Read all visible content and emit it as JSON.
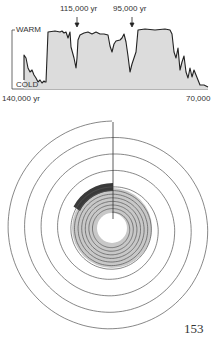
{
  "chart_data": {
    "type": "area",
    "title": "",
    "xlabel": "",
    "ylabel": "",
    "y_labels": {
      "top": "WARM",
      "bottom": "COLD"
    },
    "x_axis": {
      "start_label": "140,000 yr",
      "end_label": "70,000",
      "range": [
        140000,
        70000
      ],
      "ticks": 7
    },
    "annotations": [
      {
        "label": "115,000 yr",
        "x": 115000,
        "marker": "arrow-down"
      },
      {
        "label": "95,000 yr",
        "x": 95000,
        "marker": "arrow-down"
      }
    ],
    "series": [
      {
        "name": "climate temperature proxy",
        "x": [
          128600,
          128400,
          128200,
          128000,
          127600,
          127300,
          127000,
          126500,
          126100,
          125700,
          125300,
          125000,
          124800,
          124400,
          123000,
          122000,
          120800,
          120500,
          120000,
          119700,
          119100,
          118800,
          118300,
          118100,
          117500,
          116800,
          116000,
          115200,
          114500,
          113700,
          112800,
          112100,
          111300,
          110600,
          109800,
          109400,
          108700,
          108100,
          107600,
          106500,
          105800,
          105000,
          104600,
          103900,
          103200,
          102500,
          101800,
          101400,
          100700,
          99700,
          92400,
          91000,
          88000,
          85500,
          84400,
          84000,
          83300,
          82900,
          82100,
          81800,
          81000,
          80300,
          80000,
          79600,
          79200,
          78900,
          78400,
          77700,
          77100,
          76000,
          74600
        ],
        "values": [
          0.14,
          0.58,
          0.53,
          0.35,
          0.28,
          0.32,
          0.23,
          0.18,
          0.11,
          0.14,
          0.09,
          0.12,
          0.11,
          0.11,
          0.98,
          1.0,
          0.98,
          1.0,
          0.96,
          0.98,
          0.88,
          0.98,
          0.72,
          0.35,
          0.53,
          0.93,
          0.96,
          0.98,
          0.95,
          0.98,
          0.95,
          0.95,
          0.93,
          0.74,
          0.63,
          0.77,
          0.82,
          0.84,
          0.88,
          0.95,
          0.81,
          0.56,
          0.28,
          0.28,
          0.42,
          0.53,
          0.63,
          1.02,
          1.04,
          1.02,
          1.04,
          1.02,
          0.95,
          0.63,
          0.53,
          0.7,
          0.32,
          0.46,
          0.56,
          0.28,
          0.18,
          0.35,
          0.19,
          0.32,
          0.23,
          0.14,
          0.05,
          0.05,
          0.02,
          0.02,
          0.0
        ]
      }
    ],
    "grid": false,
    "legend": null
  },
  "diagram": {
    "spiral": {
      "turns": 11,
      "style": "archimedean-spiral",
      "start": "12 o'clock, outermost",
      "direction": "counterclockwise inward"
    },
    "dark_band": {
      "color": "#3a3a3a",
      "span": "12 o'clock to ~10 o'clock"
    },
    "gray_disk": {
      "color": "#c8c8c8"
    }
  },
  "page": {
    "number": "153"
  },
  "labels": {
    "warm": "WARM",
    "cold": "COLD",
    "start": "140,000 yr",
    "end": "70,000",
    "arrow1": "115,000 yr",
    "arrow2": "95,000 yr"
  }
}
